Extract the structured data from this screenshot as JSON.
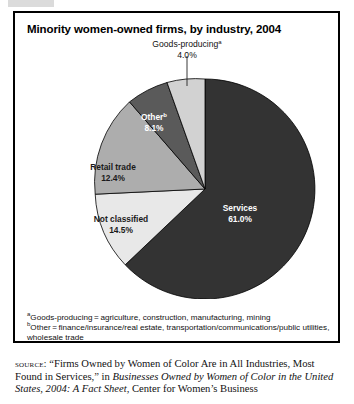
{
  "figure": {
    "title": "Minority women-owned firms, by industry, 2004"
  },
  "chart_data": {
    "type": "pie",
    "title": "Minority women-owned firms, by industry, 2004",
    "unit": "percent",
    "legend_position": "none",
    "categories": [
      "Services",
      "Not classified",
      "Retail trade",
      "Other",
      "Goods-producing"
    ],
    "values": [
      61.0,
      14.5,
      12.4,
      8.1,
      4.0
    ],
    "slices": [
      {
        "name": "Services",
        "label": "Services",
        "value_label": "61.0%",
        "value": 61.0,
        "color": "#333333",
        "label_color": "#ffffff",
        "superscript": "",
        "callout": false
      },
      {
        "name": "Not classified",
        "label": "Not classified",
        "value_label": "14.5%",
        "value": 14.5,
        "color": "#e8e8e8",
        "label_color": "#1a1a1a",
        "superscript": "",
        "callout": false
      },
      {
        "name": "Retail trade",
        "label": "Retail trade",
        "value_label": "12.4%",
        "value": 12.4,
        "color": "#adadad",
        "label_color": "#1a1a1a",
        "superscript": "",
        "callout": false
      },
      {
        "name": "Other",
        "label": "Other",
        "value_label": "8.1%",
        "value": 8.1,
        "color": "#5a5a5a",
        "label_color": "#ffffff",
        "superscript": "b",
        "callout": false
      },
      {
        "name": "Goods-producing",
        "label": "Goods-producing",
        "value_label": "4.0%",
        "value": 4.0,
        "color": "#d2d2d2",
        "label_color": "#111111",
        "superscript": "a",
        "callout": true
      }
    ]
  },
  "footnotes": [
    {
      "marker": "a",
      "text": "Goods-producing = agriculture, construction, manufacturing, mining"
    },
    {
      "marker": "b",
      "text": "Other = finance/insurance/real estate, transportation/communications/public utilities, wholesale trade"
    }
  ],
  "source": {
    "label": "source:",
    "quote": "“Firms Owned by Women of Color Are in All Industries, Most Found in Services,”",
    "in_word": "in",
    "publication": "Businesses Owned by Women of Color in the United States, 2004: A Fact Sheet",
    "publisher": ", Center for Women’s Business"
  }
}
